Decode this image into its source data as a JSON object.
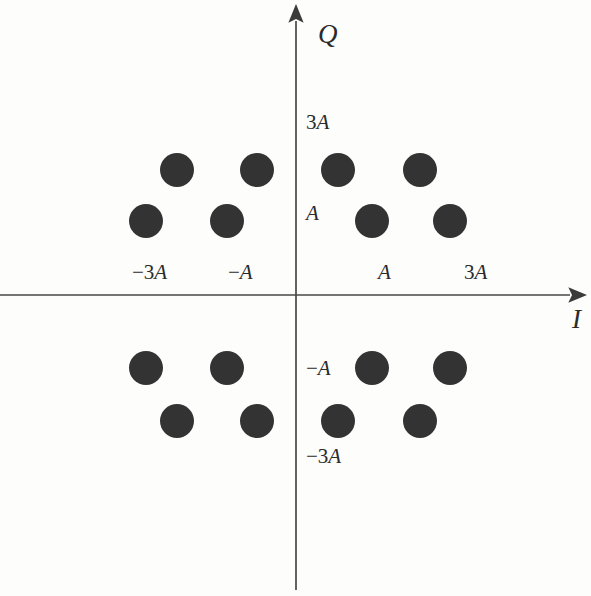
{
  "figure": {
    "title": "",
    "background_color": "#fdfdfc",
    "axis_color": "#474747",
    "point_color": "#333333"
  },
  "axes": {
    "x": {
      "name": "I",
      "label": "I",
      "label_pos": {
        "x": 572,
        "y": 306
      },
      "line": {
        "x1": 0,
        "y1": 295,
        "x2": 578,
        "y2": 295
      },
      "arrow": "right-arrow-icon",
      "ticks": [
        {
          "label_sign": "−",
          "label_num": "3",
          "label_amp": "A",
          "value": -3,
          "px": 132,
          "py": 262
        },
        {
          "label_sign": "−",
          "label_num": "",
          "label_amp": "A",
          "value": -1,
          "px": 228,
          "py": 262
        },
        {
          "label_sign": "",
          "label_num": "",
          "label_amp": "A",
          "value": 1,
          "px": 378,
          "py": 262
        },
        {
          "label_sign": "",
          "label_num": "3",
          "label_amp": "A",
          "value": 3,
          "px": 464,
          "py": 262
        }
      ]
    },
    "y": {
      "name": "Q",
      "label": "Q",
      "label_pos": {
        "x": 318,
        "y": 21
      },
      "line": {
        "x1": 296,
        "y1": 13,
        "x2": 296,
        "y2": 590
      },
      "arrow": "up-arrow-icon",
      "ticks": [
        {
          "label_sign": "",
          "label_num": "3",
          "label_amp": "A",
          "value": 3,
          "px": 306,
          "py": 112
        },
        {
          "label_sign": "",
          "label_num": "",
          "label_amp": "A",
          "value": 1,
          "px": 306,
          "py": 203
        },
        {
          "label_sign": "−",
          "label_num": "",
          "label_amp": "A",
          "value": -1,
          "px": 306,
          "py": 358
        },
        {
          "label_sign": "−",
          "label_num": "3",
          "label_amp": "A",
          "value": -3,
          "px": 306,
          "py": 446
        }
      ]
    }
  },
  "chart_data": {
    "type": "scatter",
    "title": "",
    "xlabel": "I",
    "ylabel": "Q",
    "xlim": [
      -4.2,
      4.2
    ],
    "ylim": [
      -4.2,
      4.2
    ],
    "grid": false,
    "legend": false,
    "marker": {
      "shape": "circle",
      "radius_px": 17,
      "color": "#333333"
    },
    "xtick_labels": [
      "−3A",
      "−A",
      "A",
      "3A"
    ],
    "xtick_values": [
      -3,
      -1,
      1,
      3
    ],
    "ytick_labels": [
      "3A",
      "A",
      "−A",
      "−3A"
    ],
    "ytick_values": [
      3,
      1,
      -1,
      -3
    ],
    "note": "16-point staggered QAM constellation; outer rows (Q = ±3A) are offset inward relative to inner rows (Q = ±A)",
    "points": [
      {
        "i": -3.2,
        "q": 3,
        "px": 177,
        "py": 170
      },
      {
        "i": -1.2,
        "q": 3,
        "px": 257,
        "py": 170
      },
      {
        "i": 1.1,
        "q": 3,
        "px": 338,
        "py": 170
      },
      {
        "i": 3.2,
        "q": 3,
        "px": 420,
        "py": 170
      },
      {
        "i": -3.9,
        "q": 1,
        "px": 146,
        "py": 221
      },
      {
        "i": -1.8,
        "q": 1,
        "px": 227,
        "py": 221
      },
      {
        "i": 1.9,
        "q": 1,
        "px": 372,
        "py": 221
      },
      {
        "i": 4.0,
        "q": 1,
        "px": 450,
        "py": 221
      },
      {
        "i": -3.9,
        "q": -1,
        "px": 146,
        "py": 368
      },
      {
        "i": -1.8,
        "q": -1,
        "px": 227,
        "py": 368
      },
      {
        "i": 1.9,
        "q": -1,
        "px": 372,
        "py": 368
      },
      {
        "i": 4.0,
        "q": -1,
        "px": 450,
        "py": 368
      },
      {
        "i": -3.2,
        "q": -3,
        "px": 177,
        "py": 421
      },
      {
        "i": -1.2,
        "q": -3,
        "px": 257,
        "py": 421
      },
      {
        "i": 1.1,
        "q": -3,
        "px": 338,
        "py": 421
      },
      {
        "i": 3.2,
        "q": -3,
        "px": 420,
        "py": 421
      }
    ]
  }
}
